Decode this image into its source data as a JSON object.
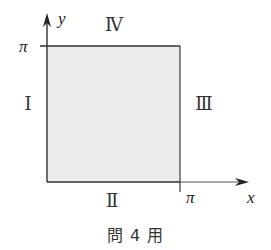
{
  "diagram": {
    "axes": {
      "x_label": "x",
      "y_label": "y",
      "x_tick_label": "π",
      "y_tick_label": "π"
    },
    "region": {
      "description": "square 0 ≤ x ≤ π, 0 ≤ y ≤ π",
      "fill_color": "#ececec",
      "edge_color": "#333333"
    },
    "edge_labels": {
      "left": "I",
      "bottom": "II",
      "right": "III",
      "top": "IV"
    },
    "left_display": "Ⅰ",
    "bottom_display": "Ⅱ",
    "right_display": "Ⅲ",
    "top_display": "Ⅳ",
    "caption": "問 4 用"
  }
}
